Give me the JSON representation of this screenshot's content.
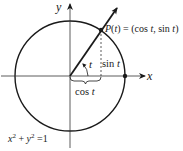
{
  "diagram": {
    "axes": {
      "x_label": "x",
      "y_label": "y"
    },
    "point_label": "P(t) = (cos t, sin t)",
    "point_label_parts": {
      "P": "P",
      "t_paren_open": "(",
      "t": "t",
      "t_paren_close": ")",
      "equals": " = (cos ",
      "t1": "t",
      "comma": ", sin ",
      "t2": "t",
      "close": ")"
    },
    "angle_label": "t",
    "sin_label": {
      "text": "sin ",
      "var": "t"
    },
    "cos_label": {
      "text": "cos ",
      "var": "t"
    },
    "equation": {
      "x": "x",
      "x_exp": "2",
      "plus": " + ",
      "y": "y",
      "y_exp": "2",
      "rhs": " =1"
    },
    "colors": {
      "stroke": "#1a1a1a",
      "background": "#ffffff"
    }
  }
}
